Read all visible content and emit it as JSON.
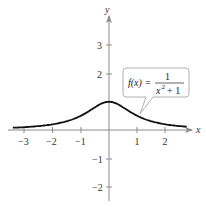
{
  "chart_data": {
    "type": "line",
    "title": "",
    "function": "f(x) = 1/(x^2 + 1)",
    "xlabel": "x",
    "ylabel": "y",
    "xlim": [
      -3.5,
      2.8
    ],
    "ylim": [
      -2.5,
      4.2
    ],
    "x_ticks": [
      -3,
      -2,
      -1,
      1,
      2
    ],
    "y_ticks": [
      -2,
      -1,
      2,
      3
    ],
    "x_tick_labels": [
      "−3",
      "−2",
      "−1",
      "1",
      "2"
    ],
    "y_tick_labels": [
      "−2",
      "−1",
      "2",
      "3"
    ],
    "grid": false,
    "series": [
      {
        "name": "f(x) = 1/(x^2+1)",
        "x": [
          -3.4,
          -3,
          -2.5,
          -2,
          -1.5,
          -1,
          -0.5,
          0,
          0.5,
          1,
          1.5,
          2,
          2.5,
          2.75
        ],
        "y": [
          0.08,
          0.1,
          0.138,
          0.2,
          0.308,
          0.5,
          0.8,
          1.0,
          0.8,
          0.5,
          0.308,
          0.2,
          0.138,
          0.117
        ]
      }
    ],
    "annotations": [
      {
        "text": "f(x) = 1 / (x² + 1)",
        "type": "callout",
        "points_to": [
          0.9,
          0.55
        ]
      }
    ]
  },
  "labels": {
    "x_axis": "x",
    "y_axis": "y",
    "callout_lhs": "f(x) =",
    "callout_num": "1",
    "callout_den_base": "x",
    "callout_den_exp": "2",
    "callout_den_rest": "+ 1"
  },
  "ticks": {
    "x": [
      {
        "value": -3,
        "label": "−3"
      },
      {
        "value": -2,
        "label": "−2"
      },
      {
        "value": -1,
        "label": "−1"
      },
      {
        "value": 1,
        "label": "1"
      },
      {
        "value": 2,
        "label": "2"
      }
    ],
    "y": [
      {
        "value": 3,
        "label": "3"
      },
      {
        "value": 2,
        "label": "2"
      },
      {
        "value": -1,
        "label": "−1"
      },
      {
        "value": -2,
        "label": "−2"
      }
    ]
  },
  "colors": {
    "axis": "#8a8a8a",
    "curve": "#111111",
    "callout_border": "#b0b0b0",
    "text": "#333333"
  }
}
